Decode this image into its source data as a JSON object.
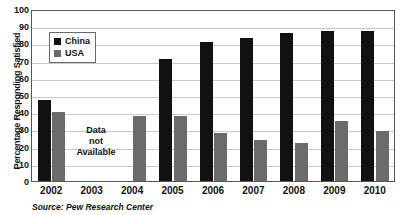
{
  "chart_data": {
    "type": "bar",
    "title": "",
    "xlabel": "",
    "ylabel": "Percentage Responding Satisfied",
    "ylim": [
      0,
      100
    ],
    "ytick_values": [
      0,
      10,
      20,
      30,
      40,
      50,
      60,
      70,
      80,
      90,
      100
    ],
    "grid": true,
    "legend_position": "upper-left-inside",
    "categories": [
      "2002",
      "2003",
      "2004",
      "2005",
      "2006",
      "2007",
      "2008",
      "2009",
      "2010"
    ],
    "series": [
      {
        "name": "China",
        "color": "#111111",
        "values": [
          47,
          null,
          null,
          71,
          81,
          83,
          86,
          87,
          87
        ]
      },
      {
        "name": "USA",
        "color": "#6b6b6b",
        "values": [
          40,
          null,
          38,
          38,
          28,
          24,
          22,
          35,
          29
        ]
      }
    ],
    "annotations": [
      {
        "name": "data-not-available",
        "text_lines": [
          "Data",
          "not",
          "Available"
        ],
        "category": "2003"
      }
    ],
    "source": "Source: Pew Research Center"
  },
  "legend": {
    "items": [
      {
        "label": "China",
        "color": "#111111"
      },
      {
        "label": "USA",
        "color": "#6b6b6b"
      }
    ]
  },
  "annotation": {
    "line1": "Data",
    "line2": "not",
    "line3": "Available"
  }
}
